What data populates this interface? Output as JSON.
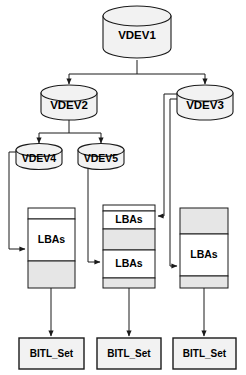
{
  "diagram": {
    "colors": {
      "stroke": "#1a1a1a",
      "cylinder_fill": "#f2f2f2",
      "band_shaded": "#e6e6e6",
      "band_white": "#ffffff",
      "box_fill": "#f2f2f2",
      "background": "#ffffff"
    },
    "vdevs": [
      {
        "id": "vdev1",
        "label": "VDEV1",
        "level": 0
      },
      {
        "id": "vdev2",
        "label": "VDEV2",
        "level": 1
      },
      {
        "id": "vdev3",
        "label": "VDEV3",
        "level": 1
      },
      {
        "id": "vdev4",
        "label": "VDEV4",
        "level": 2
      },
      {
        "id": "vdev5",
        "label": "VDEV5",
        "level": 2
      }
    ],
    "lba_columns": [
      {
        "id": "lba-col-left",
        "bands": [
          {
            "fill": "white",
            "label": ""
          },
          {
            "fill": "white",
            "label": "LBAs"
          },
          {
            "fill": "shaded",
            "label": ""
          }
        ]
      },
      {
        "id": "lba-col-middle",
        "bands": [
          {
            "fill": "white",
            "label": "LBAs"
          },
          {
            "fill": "shaded",
            "label": ""
          },
          {
            "fill": "white",
            "label": "LBAs"
          },
          {
            "fill": "shaded",
            "label": ""
          }
        ]
      },
      {
        "id": "lba-col-right",
        "bands": [
          {
            "fill": "shaded",
            "label": ""
          },
          {
            "fill": "white",
            "label": "LBAs"
          },
          {
            "fill": "shaded",
            "label": ""
          }
        ]
      }
    ],
    "bitl_sets": [
      {
        "id": "bitl-left",
        "label": "BITL_Set"
      },
      {
        "id": "bitl-middle",
        "label": "BITL_Set"
      },
      {
        "id": "bitl-right",
        "label": "BITL_Set"
      }
    ],
    "edges": [
      {
        "from": "vdev1",
        "to": "vdev2"
      },
      {
        "from": "vdev1",
        "to": "vdev3"
      },
      {
        "from": "vdev2",
        "to": "vdev4"
      },
      {
        "from": "vdev2",
        "to": "vdev5"
      },
      {
        "from": "vdev4",
        "to": "lba-col-left"
      },
      {
        "from": "vdev5",
        "to": "lba-col-middle"
      },
      {
        "from": "vdev3",
        "to": "lba-col-middle"
      },
      {
        "from": "vdev3",
        "to": "lba-col-right"
      },
      {
        "from": "lba-col-left",
        "to": "bitl-left"
      },
      {
        "from": "lba-col-middle",
        "to": "bitl-middle"
      },
      {
        "from": "lba-col-right",
        "to": "bitl-right"
      }
    ]
  }
}
